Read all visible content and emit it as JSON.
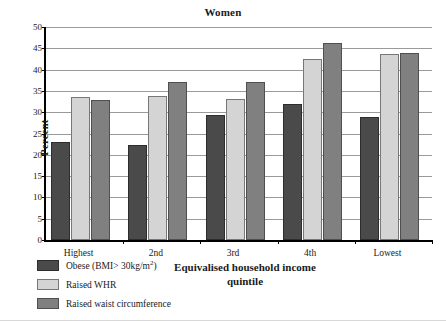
{
  "chart_data": {
    "type": "bar",
    "title": "Women",
    "xlabel": "Equivalised household income quintile",
    "ylabel": "Percent",
    "categories": [
      "Highest",
      "2nd",
      "3rd",
      "4th",
      "Lowest"
    ],
    "ylim": [
      0,
      50
    ],
    "ytick_step": 5,
    "yticks": [
      0,
      5,
      10,
      15,
      20,
      25,
      30,
      35,
      40,
      45,
      50
    ],
    "grid": true,
    "legend_position": "below-left",
    "series": [
      {
        "name": "Obese (BMI>30kg/m2)",
        "label_html": "Obese (BMI> 30kg/m",
        "label_sup": "2",
        "label_tail": ")",
        "color": "#4a4a4a",
        "values": [
          23.0,
          22.3,
          29.4,
          31.9,
          28.8
        ]
      },
      {
        "name": "Raised WHR",
        "label_html": "Raised WHR",
        "label_sup": "",
        "label_tail": "",
        "color": "#d4d4d4",
        "values": [
          33.6,
          33.8,
          33.2,
          42.5,
          43.7
        ]
      },
      {
        "name": "Raised waist circumference",
        "label_html": "Raised waist circumference",
        "label_sup": "",
        "label_tail": "",
        "color": "#808080",
        "values": [
          32.8,
          37.2,
          37.2,
          46.3,
          43.9
        ]
      }
    ]
  },
  "legend": {
    "items": [
      {
        "label": "Obese (BMI> 30kg/m",
        "sup": "2",
        "tail": ")",
        "swatch": "s0"
      },
      {
        "label": "Raised WHR",
        "sup": "",
        "tail": "",
        "swatch": "s1"
      },
      {
        "label": "Raised waist circumference",
        "sup": "",
        "tail": "",
        "swatch": "s2"
      }
    ]
  },
  "colors": {
    "series_obese": "#4a4a4a",
    "series_whr": "#d4d4d4",
    "series_waist": "#808080",
    "gridline": "#9a9a9a",
    "axis": "#000000"
  }
}
